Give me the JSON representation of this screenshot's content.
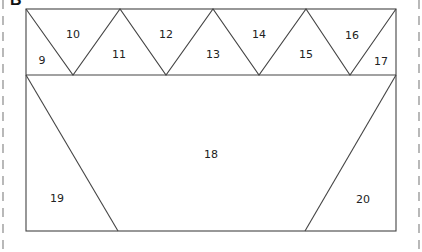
{
  "panel": {
    "letter": "B"
  },
  "colors": {
    "line": "#444444",
    "dash": "#888888",
    "text": "#222222"
  },
  "pieces": {
    "p9": {
      "label": "9",
      "x": 42,
      "y": 60
    },
    "p10": {
      "label": "10",
      "x": 73,
      "y": 37
    },
    "p11": {
      "label": "11",
      "x": 119,
      "y": 58
    },
    "p12": {
      "label": "12",
      "x": 166,
      "y": 37
    },
    "p13": {
      "label": "13",
      "x": 212,
      "y": 57
    },
    "p14": {
      "label": "14",
      "x": 259,
      "y": 37
    },
    "p15": {
      "label": "15",
      "x": 306,
      "y": 57
    },
    "p16": {
      "label": "16",
      "x": 352,
      "y": 38
    },
    "p17": {
      "label": "17",
      "x": 381,
      "y": 64
    },
    "p18": {
      "label": "18",
      "x": 211,
      "y": 158
    },
    "p19": {
      "label": "19",
      "x": 57,
      "y": 202
    },
    "p20": {
      "label": "20",
      "x": 363,
      "y": 203
    }
  }
}
